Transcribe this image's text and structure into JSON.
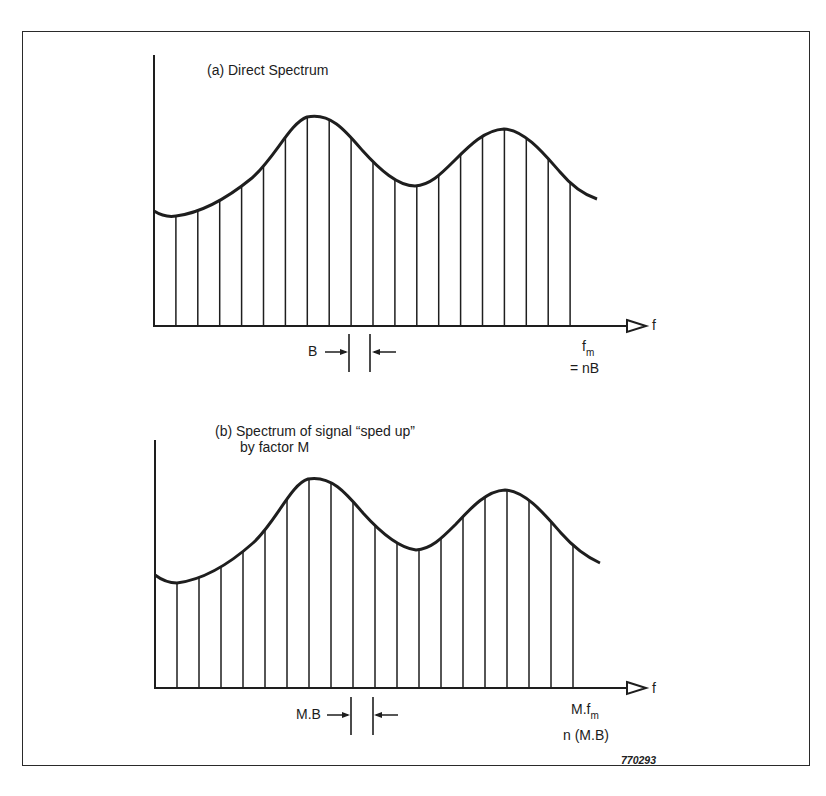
{
  "figure": {
    "id_label": "770293",
    "panel_a": {
      "title": "(a) Direct Spectrum",
      "axis_label": "f",
      "spacing_label": "B",
      "end_label_main": "f",
      "end_label_sub": "m",
      "end_label_eq": "= nB"
    },
    "panel_b": {
      "title_line1": "(b) Spectrum of signal “sped up”",
      "title_line2": "by factor M",
      "axis_label": "f",
      "spacing_label": "M.B",
      "end_label_main": "M.f",
      "end_label_sub": "m",
      "end_label_eq": "n (M.B)"
    }
  },
  "chart_data": [
    {
      "type": "bar",
      "title": "(a) Direct Spectrum",
      "xlabel": "f",
      "ylabel": "",
      "annotations": [
        "B (line spacing)",
        "f_m = nB"
      ],
      "line_count": 20,
      "spacing": "B",
      "envelope": "two-hump curve: low start, major peak near line 7, dip near line 12, second peak near line 16, falling toward f_m",
      "relative_heights": [
        0.42,
        0.4,
        0.43,
        0.49,
        0.58,
        0.69,
        0.77,
        0.8,
        0.78,
        0.7,
        0.59,
        0.53,
        0.51,
        0.55,
        0.64,
        0.72,
        0.75,
        0.72,
        0.64,
        0.53
      ],
      "grid": false,
      "legend": "none"
    },
    {
      "type": "bar",
      "title": "(b) Spectrum of signal “sped up” by factor M",
      "xlabel": "f",
      "ylabel": "",
      "annotations": [
        "M.B (line spacing)",
        "M.f_m",
        "n (M.B)"
      ],
      "line_count": 20,
      "spacing": "M.B",
      "envelope": "same shape as (a), scaled in frequency by M",
      "relative_heights": [
        0.42,
        0.4,
        0.43,
        0.49,
        0.58,
        0.69,
        0.77,
        0.8,
        0.78,
        0.7,
        0.59,
        0.53,
        0.51,
        0.55,
        0.64,
        0.72,
        0.75,
        0.72,
        0.64,
        0.53
      ],
      "grid": false,
      "legend": "none"
    }
  ]
}
